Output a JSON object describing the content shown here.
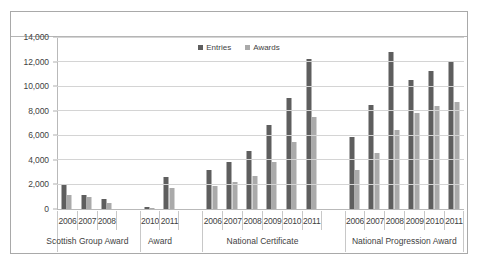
{
  "chart_data": {
    "type": "bar",
    "title": "",
    "xlabel": "",
    "ylabel": "",
    "ylim": [
      0,
      14000
    ],
    "ytick_values": [
      14000,
      12000,
      10000,
      8000,
      6000,
      4000,
      2000,
      0
    ],
    "ytick_labels": [
      "14,000",
      "12,000",
      "10,000",
      "8,000",
      "6,000",
      "4,000",
      "2,000",
      "0"
    ],
    "grid": true,
    "legend_position": "top-center",
    "series_names": [
      "Entries",
      "Awards"
    ],
    "series_colors": [
      "#5e5e5e",
      "#aaaaaa"
    ],
    "groups": [
      {
        "name": "Scottish Group Award",
        "categories": [
          "2006",
          "2007",
          "2008"
        ],
        "series": [
          {
            "name": "Entries",
            "values": [
              2000,
              1150,
              800
            ]
          },
          {
            "name": "Awards",
            "values": [
              1150,
              950,
              480
            ]
          }
        ]
      },
      {
        "name": "Award",
        "categories": [
          "2010",
          "2011"
        ],
        "series": [
          {
            "name": "Entries",
            "values": [
              200,
              2600
            ]
          },
          {
            "name": "Awards",
            "values": [
              50,
              1700
            ]
          }
        ]
      },
      {
        "name": "National Certificate",
        "categories": [
          "2006",
          "2007",
          "2008",
          "2009",
          "2010",
          "2011"
        ],
        "series": [
          {
            "name": "Entries",
            "values": [
              3200,
              3850,
              4700,
              6800,
              9000,
              12250
            ]
          },
          {
            "name": "Awards",
            "values": [
              1850,
              2200,
              2650,
              3850,
              5450,
              7450
            ]
          }
        ]
      },
      {
        "name": "National Progression Award",
        "categories": [
          "2006",
          "2007",
          "2008",
          "2009",
          "2010",
          "2011"
        ],
        "series": [
          {
            "name": "Entries",
            "values": [
              5900,
              8500,
              12750,
              10500,
              11250,
              11950
            ]
          },
          {
            "name": "Awards",
            "values": [
              3200,
              4600,
              6400,
              7800,
              8400,
              8750
            ]
          }
        ]
      }
    ]
  },
  "legend": {
    "entries_label": "Entries",
    "awards_label": "Awards"
  },
  "colors": {
    "entries": "#5e5e5e",
    "awards": "#aaaaaa",
    "grid": "#d4d4d4",
    "axis": "#b9b9b9",
    "frame": "#a9a9a9",
    "text": "#3f3f3f"
  }
}
